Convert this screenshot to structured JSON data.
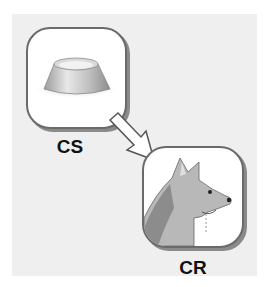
{
  "diagram": {
    "stimulus_box": {
      "label": "CS",
      "icon": "dog-bowl-icon"
    },
    "response_box": {
      "label": "CR",
      "icon": "salivating-dog-icon"
    },
    "arrow": {
      "from": "CS",
      "to": "CR"
    }
  },
  "colors": {
    "background": "#efefef",
    "box_border": "#6a6a6a",
    "text": "#111111"
  }
}
